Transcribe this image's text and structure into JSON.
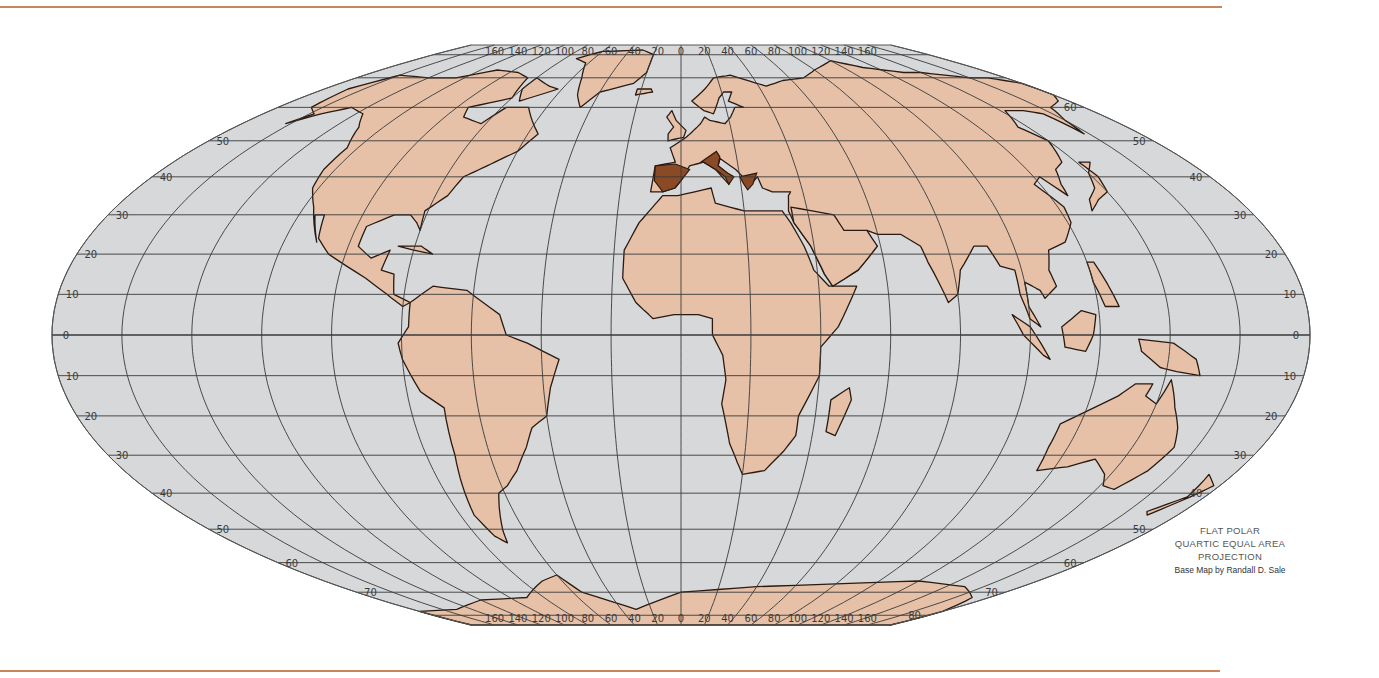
{
  "map": {
    "projection": "Flat Polar Quartic Equal Area",
    "colors": {
      "ocean": "#d6d8da",
      "land": "#e6c1a7",
      "highlight": "#8a4a25",
      "border": "#2a1a12",
      "graticule": "#3a3a3a",
      "rule": "#c9855a"
    },
    "top_longitude_labels": [
      "80",
      "140",
      "120",
      "100",
      "80",
      "60",
      "40",
      "20",
      "0",
      "20",
      "40",
      "60",
      "80",
      "100",
      "120",
      "140",
      "160",
      "80"
    ],
    "bottom_longitude_labels": [
      "140",
      "120",
      "100",
      "80",
      "60",
      "40",
      "20",
      "0",
      "20",
      "40",
      "60",
      "80",
      "100",
      "120",
      "140",
      "160",
      "80"
    ],
    "left_latitude_labels": [
      "50",
      "40",
      "30",
      "20",
      "10",
      "0",
      "10",
      "20",
      "30",
      "40",
      "50",
      "60",
      "70"
    ],
    "right_latitude_labels": [
      "60",
      "50",
      "40",
      "30",
      "20",
      "10",
      "0",
      "10",
      "20",
      "30",
      "40",
      "50",
      "60",
      "70",
      "80"
    ],
    "highlighted_regions": [
      "Spain",
      "Italy",
      "Greece"
    ]
  },
  "caption": {
    "line1": "FLAT POLAR",
    "line2": "QUARTIC EQUAL AREA",
    "line3": "PROJECTION",
    "credit": "Base Map by Randall D. Sale"
  }
}
